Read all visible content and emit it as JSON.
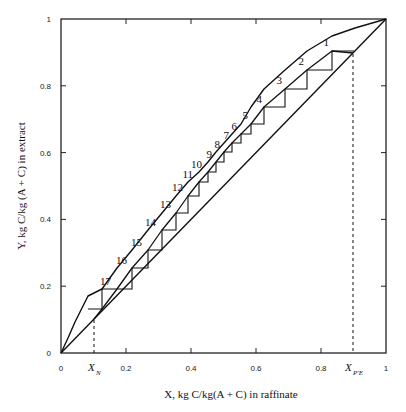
{
  "chart_data": {
    "type": "line",
    "title": "",
    "xlabel": "X, kg C/kg(A + C) in raffinate",
    "ylabel": "Y, kg C/kg (A + C) in extract",
    "xlim": [
      0,
      1
    ],
    "ylim": [
      0,
      1
    ],
    "grid": false,
    "x_ticks": [
      "0",
      "0.2",
      "0.4",
      "0.6",
      "0.8",
      "1"
    ],
    "y_ticks": [
      "0",
      "0.2",
      "0.4",
      "0.6",
      "0.8",
      "1"
    ],
    "annotations": {
      "x_n": {
        "main": "X",
        "sub": "N",
        "x": 0.1
      },
      "x_pe": {
        "main": "X",
        "sub": "P'E",
        "x": 0.9
      }
    },
    "series": [
      {
        "name": "Equilibrium curve",
        "x": [
          0,
          0.04,
          0.08,
          0.125,
          0.172,
          0.218,
          0.266,
          0.312,
          0.35,
          0.387,
          0.422,
          0.45,
          0.478,
          0.504,
          0.529,
          0.551,
          0.584,
          0.625,
          0.69,
          0.757,
          0.834,
          1
        ],
        "y": [
          0,
          0.1,
          0.17,
          0.24,
          0.3,
          0.36,
          0.41,
          0.465,
          0.51,
          0.545,
          0.512,
          0.59,
          0.62,
          0.648,
          0.675,
          0.7,
          0.737,
          0.79,
          0.84,
          0.89,
          0.905,
          1
        ]
      },
      {
        "name": "Operating line",
        "x": [
          0.1,
          0.18,
          0.27,
          0.36,
          0.45,
          0.55,
          0.65,
          0.75,
          0.825,
          0.9
        ],
        "y": [
          0.1,
          0.19,
          0.29,
          0.39,
          0.49,
          0.59,
          0.69,
          0.78,
          0.85,
          0.9
        ]
      },
      {
        "name": "Diagonal y = x",
        "x": [
          0,
          1
        ],
        "y": [
          0,
          1
        ]
      }
    ],
    "stages": {
      "count": 17,
      "labels": [
        "1",
        "2",
        "3",
        "4",
        "5",
        "6",
        "7",
        "8",
        "9",
        "10",
        "11",
        "12",
        "13",
        "14",
        "15",
        "16",
        "17"
      ]
    }
  },
  "plot": {
    "left": 61,
    "right": 386,
    "top": 19,
    "bottom": 353,
    "eq_curve_px": [
      [
        61,
        353
      ],
      [
        68,
        338
      ],
      [
        75,
        322
      ],
      [
        82,
        308
      ],
      [
        88,
        296
      ],
      [
        102,
        289
      ],
      [
        117,
        268
      ],
      [
        132,
        250
      ],
      [
        148,
        230
      ],
      [
        162,
        213
      ],
      [
        176,
        196
      ],
      [
        188,
        182
      ],
      [
        199,
        172
      ],
      [
        208,
        162
      ],
      [
        216,
        152
      ],
      [
        224,
        143
      ],
      [
        232,
        134
      ],
      [
        241,
        124
      ],
      [
        251,
        107
      ],
      [
        264,
        89
      ],
      [
        285,
        70
      ],
      [
        307,
        51
      ],
      [
        332,
        36
      ],
      [
        355,
        28
      ],
      [
        386,
        19
      ]
    ],
    "op_line_px": [
      [
        94,
        319
      ],
      [
        102,
        309
      ],
      [
        117,
        289
      ],
      [
        132,
        268
      ],
      [
        148,
        250
      ],
      [
        162,
        230
      ],
      [
        176,
        213
      ],
      [
        188,
        196
      ],
      [
        199,
        182
      ],
      [
        208,
        172
      ],
      [
        216,
        162
      ],
      [
        224,
        152
      ],
      [
        232,
        143
      ],
      [
        241,
        134
      ],
      [
        251,
        124
      ],
      [
        264,
        107
      ],
      [
        285,
        89
      ],
      [
        307,
        70
      ],
      [
        332,
        51
      ],
      [
        353,
        53
      ]
    ],
    "steps_px": [
      [
        354,
        51
      ],
      [
        332,
        51
      ],
      [
        332,
        70
      ],
      [
        307,
        70
      ],
      [
        307,
        89
      ],
      [
        285,
        89
      ],
      [
        285,
        107
      ],
      [
        264,
        107
      ],
      [
        264,
        124
      ],
      [
        251,
        124
      ],
      [
        251,
        134
      ],
      [
        241,
        134
      ],
      [
        241,
        143
      ],
      [
        232,
        143
      ],
      [
        232,
        152
      ],
      [
        224,
        152
      ],
      [
        224,
        162
      ],
      [
        216,
        162
      ],
      [
        216,
        172
      ],
      [
        208,
        172
      ],
      [
        208,
        182
      ],
      [
        199,
        182
      ],
      [
        199,
        196
      ],
      [
        188,
        196
      ],
      [
        188,
        213
      ],
      [
        176,
        213
      ],
      [
        176,
        230
      ],
      [
        162,
        230
      ],
      [
        162,
        250
      ],
      [
        148,
        250
      ],
      [
        148,
        268
      ],
      [
        132,
        268
      ],
      [
        132,
        289
      ],
      [
        117,
        289
      ],
      [
        117,
        289
      ],
      [
        102,
        289
      ],
      [
        102,
        309
      ],
      [
        88,
        309
      ]
    ],
    "label_pos": [
      [
        329,
        46
      ],
      [
        304,
        65
      ],
      [
        282,
        84
      ],
      [
        262,
        103
      ],
      [
        248,
        119
      ],
      [
        237,
        130
      ],
      [
        229,
        139
      ],
      [
        220,
        148
      ],
      [
        212,
        158
      ],
      [
        202,
        168
      ],
      [
        193,
        178
      ],
      [
        183,
        191
      ],
      [
        171,
        208
      ],
      [
        156,
        226
      ],
      [
        142,
        246
      ],
      [
        127,
        264
      ],
      [
        111,
        285
      ]
    ]
  }
}
